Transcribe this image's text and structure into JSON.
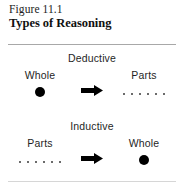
{
  "figure": {
    "number": "Figure 11.1",
    "title": "Types of Reasoning",
    "background_color": "#ffffff",
    "ink_color": "#1f1f1f",
    "rule_color": "#a8a8a8"
  },
  "sections": [
    {
      "heading": "Deductive",
      "left": {
        "label": "Whole",
        "glyph": "solid-circle-icon",
        "dot_count": 1
      },
      "arrow": {
        "icon": "right-block-arrow-icon",
        "direction": "right"
      },
      "right": {
        "label": "Parts",
        "glyph": "dot-row-icon",
        "dot_count": 6
      }
    },
    {
      "heading": "Inductive",
      "left": {
        "label": "Parts",
        "glyph": "dot-row-icon",
        "dot_count": 6
      },
      "arrow": {
        "icon": "right-block-arrow-icon",
        "direction": "right"
      },
      "right": {
        "label": "Whole",
        "glyph": "solid-circle-icon",
        "dot_count": 1
      }
    }
  ]
}
